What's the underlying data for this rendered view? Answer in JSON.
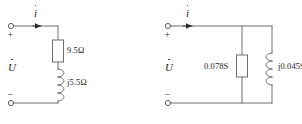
{
  "figure": {
    "type": "electrical-circuit-diagram",
    "stroke_color": "#6e6e6e",
    "text_color": "#1a1a1a",
    "background": "#ffffff"
  },
  "circuits": [
    {
      "id": "series-impedance",
      "name": "series-rl-circuit",
      "current_label": "i",
      "voltage_label": "U",
      "polarity_positive": "+",
      "polarity_negative": "−",
      "components": [
        {
          "id": "resistor",
          "symbol": "resistor",
          "label": "9.5Ω",
          "orientation": "vertical"
        },
        {
          "id": "inductor",
          "symbol": "inductor",
          "label": "j5.5Ω",
          "orientation": "vertical"
        }
      ]
    },
    {
      "id": "parallel-admittance",
      "name": "parallel-gb-circuit",
      "current_label": "i",
      "voltage_label": "U",
      "polarity_positive": "+",
      "polarity_negative": "−",
      "components": [
        {
          "id": "conductance",
          "symbol": "resistor",
          "label": "0.078S",
          "orientation": "vertical"
        },
        {
          "id": "susceptance",
          "symbol": "inductor",
          "label": "j0.045S",
          "orientation": "vertical"
        }
      ]
    }
  ]
}
